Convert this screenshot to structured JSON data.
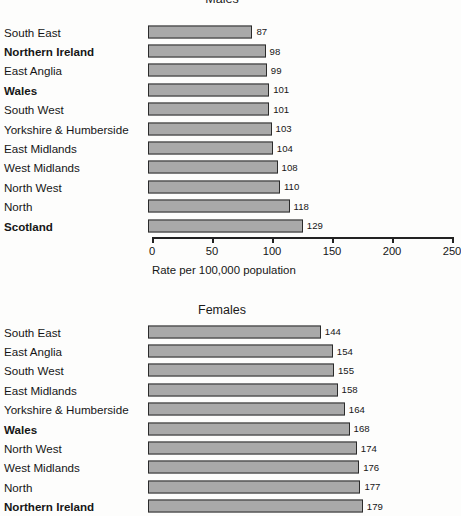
{
  "chart_data": {
    "type": "bar",
    "orientation": "horizontal",
    "title": "",
    "xlabel": "Rate per 100,000 population",
    "ylabel": "",
    "xlim": [
      0,
      250
    ],
    "xticks": [
      0,
      50,
      100,
      150,
      200,
      250
    ],
    "grid": false,
    "legend": null,
    "panels": [
      {
        "id": "males",
        "title": "Males",
        "categories": [
          "South East",
          "Northern Ireland",
          "East Anglia",
          "Wales",
          "South West",
          "Yorkshire & Humberside",
          "East Midlands",
          "West Midlands",
          "North West",
          "North",
          "Scotland"
        ],
        "values": [
          87,
          98,
          99,
          101,
          101,
          103,
          104,
          108,
          110,
          118,
          129
        ],
        "emphasised": [
          "Northern Ireland",
          "Wales",
          "Scotland"
        ],
        "axis": {
          "label": "Rate per 100,000 population",
          "ticks": [
            {
              "value": 0,
              "label": "0"
            },
            {
              "value": 50,
              "label": "50"
            },
            {
              "value": 100,
              "label": "100"
            },
            {
              "value": 150,
              "label": "150"
            },
            {
              "value": 200,
              "label": "200"
            },
            {
              "value": 250,
              "label": "250"
            }
          ]
        }
      },
      {
        "id": "females",
        "title": "Females",
        "categories": [
          "South East",
          "East Anglia",
          "South West",
          "East Midlands",
          "Yorkshire & Humberside",
          "Wales",
          "North West",
          "West Midlands",
          "North",
          "Northern Ireland"
        ],
        "values": [
          144,
          154,
          155,
          158,
          164,
          168,
          174,
          176,
          177,
          179
        ],
        "emphasised": [
          "Wales",
          "Northern Ireland"
        ],
        "axis": null
      }
    ]
  },
  "style": {
    "bar_fill": "#a9a9a9",
    "bar_stroke": "#2b2b2b",
    "text_color": "#161616",
    "background": "#fdfdfc"
  }
}
